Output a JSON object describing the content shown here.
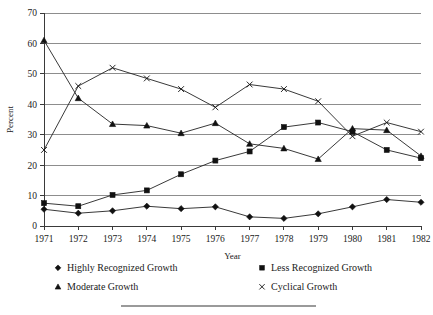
{
  "chart_data": {
    "type": "line",
    "title": "",
    "xlabel": "Year",
    "ylabel": "Percent",
    "categories": [
      "1971",
      "1972",
      "1973",
      "1974",
      "1975",
      "1976",
      "1977",
      "1978",
      "1979",
      "1980",
      "1981",
      "1982"
    ],
    "x": [
      1971,
      1972,
      1973,
      1974,
      1975,
      1976,
      1977,
      1978,
      1979,
      1980,
      1981,
      1982
    ],
    "ylim": [
      0,
      70
    ],
    "ytick_step": 10,
    "yticks": [
      0,
      10,
      20,
      30,
      40,
      50,
      60,
      70
    ],
    "grid": "horizontal",
    "legend_position": "bottom",
    "series": [
      {
        "name": "Highly Recognized Growth",
        "marker": "diamond",
        "values": [
          5.5,
          4.2,
          5.0,
          6.5,
          5.7,
          6.3,
          3.0,
          2.5,
          4.0,
          6.3,
          8.7,
          7.8
        ]
      },
      {
        "name": "Less Recognized Growth",
        "marker": "square",
        "values": [
          7.5,
          6.5,
          10.2,
          11.7,
          17.0,
          21.5,
          24.5,
          32.5,
          34.0,
          31.0,
          25.0,
          22.3
        ]
      },
      {
        "name": "Moderate Growth",
        "marker": "triangle",
        "values": [
          61.0,
          42.0,
          33.5,
          33.0,
          30.5,
          33.8,
          27.0,
          25.5,
          22.0,
          32.0,
          31.5,
          23.0
        ]
      },
      {
        "name": "Cyclical Growth",
        "marker": "cross",
        "values": [
          25.0,
          46.0,
          52.0,
          48.5,
          45.0,
          39.0,
          46.5,
          45.0,
          41.0,
          29.5,
          34.0,
          31.0
        ]
      }
    ]
  },
  "legend": {
    "entries": [
      {
        "label": "Highly Recognized Growth",
        "marker": "diamond"
      },
      {
        "label": "Less Recognized Growth",
        "marker": "square"
      },
      {
        "label": "Moderate Growth",
        "marker": "triangle"
      },
      {
        "label": "Cyclical Growth",
        "marker": "cross"
      }
    ]
  },
  "colors": {
    "ink": "#111111",
    "grid": "#8d8d8d",
    "axis": "#3a3a3a",
    "background": "#ffffff"
  }
}
